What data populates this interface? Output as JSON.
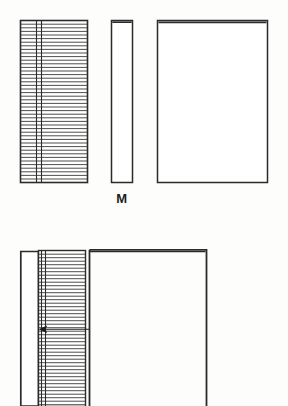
{
  "figure": {
    "caption_label": "M",
    "ink_color": "#2b2b2b",
    "paper_color": "#fdfdfc",
    "leaf_line_color": "#3a3a3a",
    "upper_views": [
      {
        "name": "fore-edge-view",
        "description": "text block seen from the fore-edge showing stacked leaves",
        "x": 20,
        "y": 20,
        "width": 68,
        "height": 163,
        "leaf_count": 44,
        "vertical_rules": [
          36,
          41
        ]
      },
      {
        "name": "spine-view",
        "description": "narrow spine elevation of the bound volume",
        "x": 111,
        "y": 20,
        "width": 22,
        "height": 163
      },
      {
        "name": "cover-view",
        "description": "front cover elevation of the bound volume",
        "x": 157,
        "y": 20,
        "width": 111,
        "height": 163
      }
    ],
    "lower_view": {
      "name": "section-view",
      "description": "part section through the cover and text block, cropped at sheet edge",
      "cover_x": 20,
      "cover_y": 251,
      "cover_width": 18,
      "cover_height": 155,
      "block_x": 38,
      "block_y": 250,
      "block_width": 48,
      "block_height": 156,
      "board_x": 89,
      "board_y": 249,
      "board_width": 118,
      "board_height": 157,
      "leaf_count": 44,
      "vertical_rules": [
        41,
        45
      ],
      "leader": {
        "name": "leader-line",
        "arrow_x": 40,
        "arrow_y": 329,
        "line_end_x": 89
      }
    }
  }
}
